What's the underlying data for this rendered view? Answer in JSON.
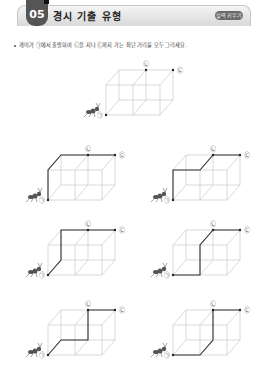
{
  "header": {
    "number": "05",
    "title": "경시 기출 유형",
    "badge": "실력 키우기"
  },
  "instruction": "개미가 ㉠에서 출발하여 ㉡을 지나 ㉢까지 가는 최단 거리를 모두 그리세요.",
  "labels": {
    "start": "㉠",
    "via": "㉡",
    "end": "㉢"
  },
  "colors": {
    "cube_line": "#c8c8c8",
    "path_line": "#333333",
    "tab": "#555555"
  },
  "figures": [
    {
      "name": "example",
      "path": []
    },
    {
      "name": "answer-1",
      "path": [
        "A",
        "E",
        "H",
        "M",
        "G"
      ]
    },
    {
      "name": "answer-2",
      "path": [
        "A",
        "E",
        "F",
        "M",
        "G"
      ]
    },
    {
      "name": "answer-3",
      "path": [
        "A",
        "D",
        "H",
        "M",
        "G"
      ]
    },
    {
      "name": "answer-4",
      "path": [
        "A",
        "B",
        "F",
        "M",
        "G"
      ]
    },
    {
      "name": "answer-5",
      "path": [
        "A",
        "D",
        "N",
        "M",
        "G"
      ]
    },
    {
      "name": "answer-6",
      "path": [
        "A",
        "B",
        "P",
        "M",
        "G"
      ]
    }
  ]
}
